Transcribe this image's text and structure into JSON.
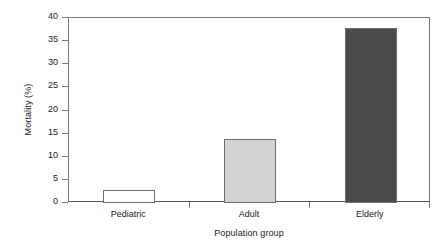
{
  "chart_data": {
    "type": "bar",
    "title": "",
    "xlabel": "Population group",
    "ylabel": "Mortality (%)",
    "categories": [
      "Pediatric",
      "Adult",
      "Elderly"
    ],
    "values": [
      2.8,
      13.8,
      37.8
    ],
    "ylim": [
      0,
      40
    ],
    "ytick_labels": [
      "0",
      "5",
      "10",
      "15",
      "20",
      "25",
      "30",
      "35",
      "40"
    ],
    "ytick_values": [
      0,
      5,
      10,
      15,
      20,
      25,
      30,
      35,
      40
    ],
    "ytick_step": 5,
    "grid": false,
    "legend": "none",
    "bar_colors": [
      "#ffffff",
      "#d2d2d2",
      "#4a4a4a"
    ],
    "bar_edge_color": "#6d6d6d",
    "axis_color": "#7a7a7a",
    "background": "#ffffff"
  },
  "axes": {
    "y_title": "Mortality (%)",
    "x_title": "Population group"
  },
  "ticks": {
    "y": [
      {
        "label": "40",
        "value": 40
      },
      {
        "label": "35",
        "value": 35
      },
      {
        "label": "30",
        "value": 30
      },
      {
        "label": "25",
        "value": 25
      },
      {
        "label": "20",
        "value": 20
      },
      {
        "label": "15",
        "value": 15
      },
      {
        "label": "10",
        "value": 10
      },
      {
        "label": "5",
        "value": 5
      },
      {
        "label": "0",
        "value": 0
      }
    ],
    "x": [
      {
        "label": "Pediatric",
        "value": 2.8
      },
      {
        "label": "Adult",
        "value": 13.8
      },
      {
        "label": "Elderly",
        "value": 37.8
      }
    ]
  }
}
